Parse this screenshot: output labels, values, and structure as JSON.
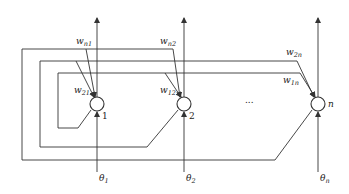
{
  "diagram": {
    "type": "hopfield-network",
    "nodes": [
      {
        "id": "1",
        "label": "1",
        "threshold_base": "θ",
        "threshold_sub": "1"
      },
      {
        "id": "2",
        "label": "2",
        "threshold_base": "θ",
        "threshold_sub": "2"
      },
      {
        "id": "n",
        "label": "n",
        "threshold_base": "θ",
        "threshold_sub": "n"
      }
    ],
    "ellipsis": "...",
    "weights": [
      {
        "base": "w",
        "sub": "n1"
      },
      {
        "base": "w",
        "sub": "21"
      },
      {
        "base": "w",
        "sub": "n2"
      },
      {
        "base": "w",
        "sub": "12"
      },
      {
        "base": "w",
        "sub": "2n"
      },
      {
        "base": "w",
        "sub": "1n"
      }
    ],
    "colors": {
      "line": "#333333",
      "background": "#ffffff"
    }
  }
}
